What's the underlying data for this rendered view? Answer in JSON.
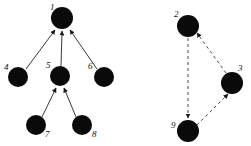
{
  "figure": {
    "width": 251,
    "height": 146,
    "background": "#ffffff",
    "node_color": "#0a0a0a",
    "edge_color": "#3a3a3a",
    "label_color": "#111111"
  },
  "graphs": [
    {
      "name": "left-graph",
      "edge_style": "solid",
      "nodes": [
        {
          "id": "1",
          "label": "1",
          "cx": 62,
          "cy": 18,
          "r": 11,
          "label_x": 50,
          "label_y": 8
        },
        {
          "id": "4",
          "label": "4",
          "cx": 18,
          "cy": 77,
          "r": 10,
          "label_x": 5,
          "label_y": 70
        },
        {
          "id": "5",
          "label": "5",
          "cx": 60,
          "cy": 76,
          "r": 10,
          "label_x": 46,
          "label_y": 68
        },
        {
          "id": "6",
          "label": "6",
          "cx": 104,
          "cy": 77,
          "r": 10,
          "label_x": 89,
          "label_y": 69
        },
        {
          "id": "7",
          "label": "7",
          "cx": 36,
          "cy": 125,
          "r": 10,
          "label_x": 45,
          "label_y": 137
        },
        {
          "id": "8",
          "label": "8",
          "cx": 82,
          "cy": 125,
          "r": 10,
          "label_x": 92,
          "label_y": 137
        }
      ],
      "edges": [
        {
          "from": "4",
          "to": "1",
          "directed": true
        },
        {
          "from": "5",
          "to": "1",
          "directed": true
        },
        {
          "from": "6",
          "to": "1",
          "directed": true
        },
        {
          "from": "7",
          "to": "5",
          "directed": true
        },
        {
          "from": "8",
          "to": "5",
          "directed": true
        }
      ]
    },
    {
      "name": "right-graph",
      "edge_style": "dashed",
      "nodes": [
        {
          "id": "2",
          "label": "2",
          "cx": 188,
          "cy": 26,
          "r": 11,
          "label_x": 174,
          "label_y": 16
        },
        {
          "id": "3",
          "label": "3",
          "cx": 232,
          "cy": 83,
          "r": 11,
          "label_x": 238,
          "label_y": 70
        },
        {
          "id": "9",
          "label": "9",
          "cx": 188,
          "cy": 131,
          "r": 11,
          "label_x": 172,
          "label_y": 127
        }
      ],
      "edges": [
        {
          "from": "2",
          "to": "9",
          "directed": true
        },
        {
          "from": "3",
          "to": "2",
          "directed": true
        },
        {
          "from": "9",
          "to": "3",
          "directed": true
        }
      ]
    }
  ]
}
